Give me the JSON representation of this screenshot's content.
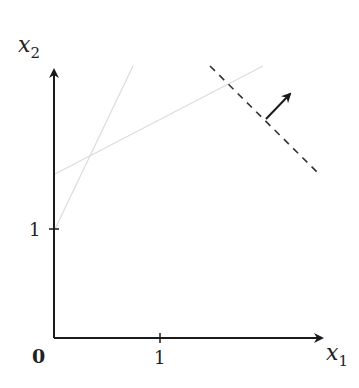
{
  "diagram": {
    "type": "linear-program-feasible-region",
    "axes": {
      "x_label": "x",
      "x_subscript": "1",
      "y_label": "x",
      "y_subscript": "2",
      "origin_label": "0",
      "x_tick_label": "1",
      "y_tick_label": "1"
    },
    "constraint_lines": [
      {
        "name": "constraint-1",
        "description": "faint line from (0,1) rising steeply"
      },
      {
        "name": "constraint-2",
        "description": "faint line from (0,~1.5) rising gently"
      }
    ],
    "objective_line": {
      "style": "dashed",
      "description": "level set of objective"
    },
    "gradient_arrow": {
      "description": "objective direction arrow perpendicular to dashed line"
    },
    "colors": {
      "axis": "#1a1a1a",
      "constraint": "#d8d8d8",
      "objective": "#333333"
    }
  }
}
